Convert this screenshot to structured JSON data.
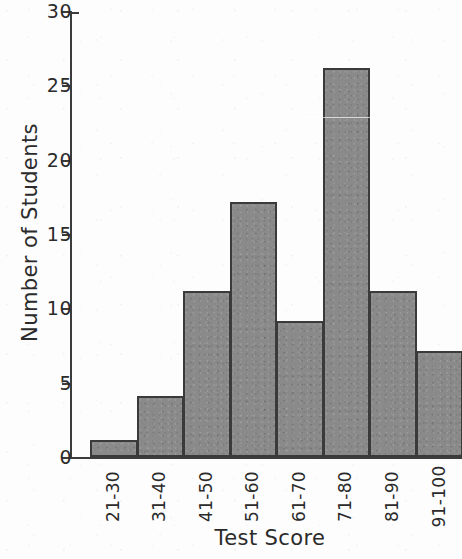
{
  "chart_data": {
    "type": "bar",
    "title": "",
    "xlabel": "Test Score",
    "ylabel": "Number of Students",
    "categories": [
      "21-30",
      "31-40",
      "41-50",
      "51-60",
      "61-70",
      "71-80",
      "81-90",
      "91-100"
    ],
    "values": [
      1,
      4,
      11,
      17,
      9,
      26,
      11,
      7
    ],
    "series": [
      {
        "name": "Number of Students",
        "values": [
          1,
          4,
          11,
          17,
          9,
          26,
          11,
          7
        ]
      }
    ],
    "ylim": [
      0,
      30
    ],
    "y_tick_values": [
      0,
      5,
      10,
      15,
      20,
      25,
      30
    ],
    "y_tick_labels": [
      "0",
      "5",
      "10",
      "15",
      "20",
      "25",
      "30"
    ],
    "y_tick_step": 5,
    "grid": false,
    "legend": false,
    "legend_position": "none",
    "bar_fill_color": "#8a8a8a",
    "bar_border_color": "#3a3a3a",
    "axis_color": "#3c3c3c",
    "background_color": "#fdfdfd",
    "text_color": "#2b2b2b"
  }
}
